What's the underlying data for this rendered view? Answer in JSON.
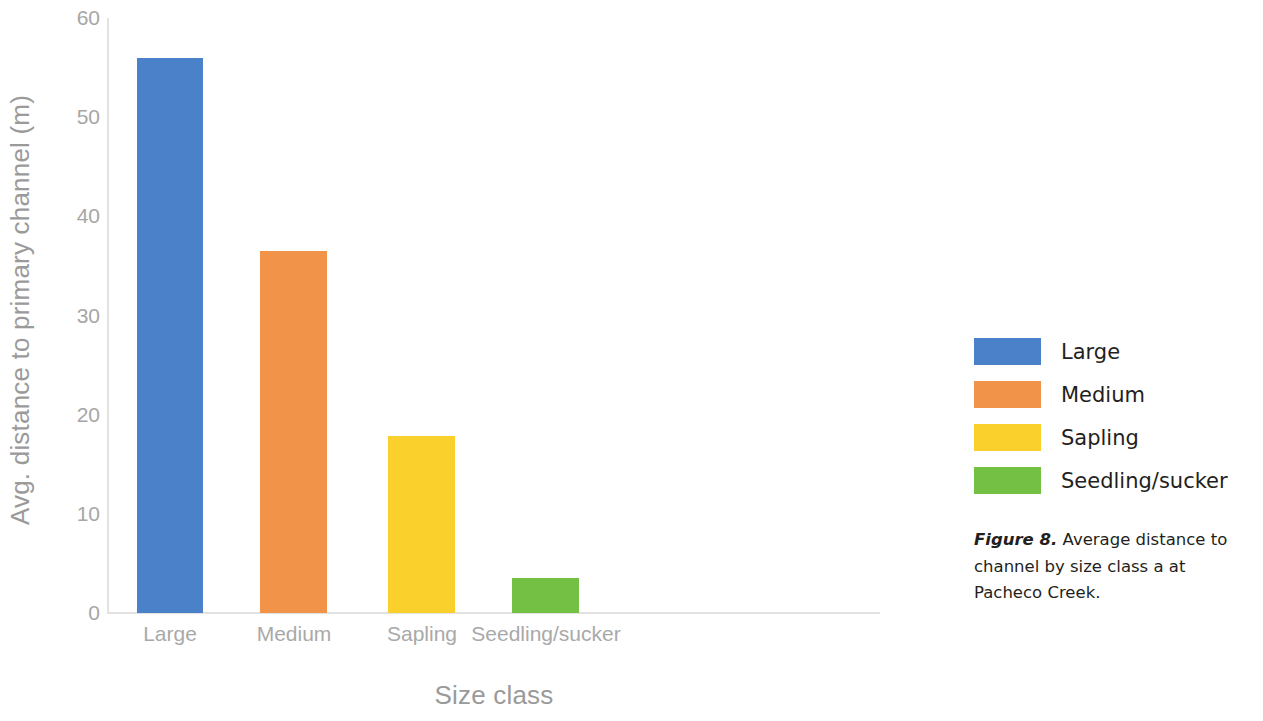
{
  "chart_data": {
    "type": "bar",
    "title": "",
    "xlabel": "Size class",
    "ylabel": "Avg. distance to primary channel (m)",
    "categories": [
      "Large",
      "Medium",
      "Sapling",
      "Seedling/sucker"
    ],
    "values": [
      56.0,
      36.5,
      17.8,
      3.5
    ],
    "series": [
      {
        "name": "Avg. distance to primary channel (m)",
        "values": [
          56.0,
          36.5,
          17.8,
          3.5
        ]
      }
    ],
    "colors": [
      "#4a81c9",
      "#f2934a",
      "#fad02c",
      "#74c044"
    ],
    "ylim": [
      0,
      60
    ],
    "yticks": [
      0,
      10,
      20,
      30,
      40,
      50,
      60
    ],
    "ytick_labels": [
      "0",
      "10",
      "20",
      "30",
      "40",
      "50",
      "60"
    ],
    "grid": false,
    "legend_position": "right"
  },
  "axis": {
    "y_title": "Avg. distance to primary channel (m)",
    "x_title": "Size class",
    "y_ticks": [
      "60",
      "50",
      "40",
      "30",
      "20",
      "10",
      "0"
    ],
    "x_ticks": [
      "Large",
      "Medium",
      "Sapling",
      "Seedling/sucker"
    ]
  },
  "legend": {
    "items": [
      {
        "label": "Large",
        "color": "#4a81c9"
      },
      {
        "label": "Medium",
        "color": "#f2934a"
      },
      {
        "label": "Sapling",
        "color": "#fad02c"
      },
      {
        "label": "Seedling/sucker",
        "color": "#74c044"
      }
    ]
  },
  "caption": {
    "label": "Figure 8.",
    "text": " Average distance to channel by size class a at Pacheco Creek."
  }
}
